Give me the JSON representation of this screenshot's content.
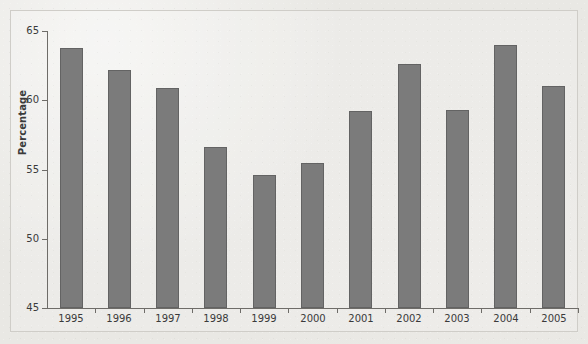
{
  "chart_data": {
    "type": "bar",
    "title": "",
    "subtitle": "",
    "xlabel": "",
    "ylabel": "Percentage",
    "categories": [
      "1995",
      "1996",
      "1997",
      "1998",
      "1999",
      "2000",
      "2001",
      "2002",
      "2003",
      "2004",
      "2005"
    ],
    "values": [
      63.8,
      62.2,
      60.9,
      56.6,
      54.6,
      55.5,
      59.2,
      62.6,
      59.3,
      64.0,
      61.0
    ],
    "ylim": [
      45,
      65
    ],
    "y_ticks": [
      45,
      50,
      55,
      60,
      65
    ],
    "y_tick_labels": [
      "45",
      "50",
      "55",
      "60",
      "65"
    ],
    "grid": false,
    "legend": null,
    "annotations": [],
    "colors": {
      "bar_fill": "#7b7b7b",
      "bar_edge": "#636363",
      "axis": "#6e6c68",
      "text": "#3a3a3a",
      "background": "#e9e8e4",
      "frame": "#cfcdc8"
    }
  }
}
